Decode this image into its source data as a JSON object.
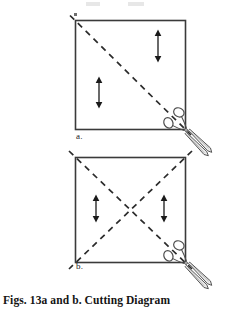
{
  "figure": {
    "caption": "Figs. 13a and b. Cutting Diagram",
    "panels": [
      {
        "id": "a",
        "label": "a.",
        "shape": "square",
        "square": {
          "x": 75,
          "y": 20,
          "width": 111,
          "height": 110
        },
        "cut_lines": [
          {
            "name": "diagonal-tl-br",
            "style": "dashed",
            "from": [
              75,
              20
            ],
            "to": [
              186,
              130
            ]
          }
        ],
        "grain_arrows": [
          {
            "name": "grain-arrow-upper-right",
            "x": 158,
            "y1": 30,
            "y2": 62
          },
          {
            "name": "grain-arrow-lower-left",
            "x": 99,
            "y1": 77,
            "y2": 108
          }
        ],
        "scissors": {
          "name": "scissors-icon",
          "x": 186,
          "y": 130,
          "angle": 45
        }
      },
      {
        "id": "b",
        "label": "b.",
        "shape": "square",
        "square": {
          "x": 75,
          "y": 157,
          "width": 111,
          "height": 106
        },
        "cut_lines": [
          {
            "name": "diagonal-tl-br",
            "style": "dashed",
            "from": [
              75,
              157
            ],
            "to": [
              186,
              263
            ]
          },
          {
            "name": "diagonal-tr-bl",
            "style": "dashed",
            "from": [
              186,
              157
            ],
            "to": [
              75,
              263
            ]
          }
        ],
        "grain_arrows": [
          {
            "name": "grain-arrow-left",
            "x": 96,
            "y1": 195,
            "y2": 222
          },
          {
            "name": "grain-arrow-right",
            "x": 164,
            "y1": 195,
            "y2": 222
          }
        ],
        "scissors": {
          "name": "scissors-icon",
          "x": 186,
          "y": 263,
          "angle": 45
        }
      }
    ]
  },
  "style": {
    "background": "#ffffff",
    "line_color": "#3a3a3a",
    "dash_color": "#2b2b2b",
    "arrow_color": "#1a1a1a",
    "scissors_color": "#555555",
    "text_color": "#141414"
  }
}
